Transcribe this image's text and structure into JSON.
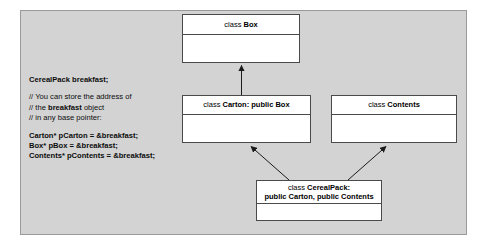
{
  "diagram": {
    "panel_color": "#d3d3d3",
    "box_fill": "#ffffff",
    "border_color": "#4a4a4a",
    "text_color": "#000000"
  },
  "classes": [
    {
      "id": "box",
      "keyword": "class",
      "name": "Box",
      "lines": [
        {
          "kw": "class",
          "nm": "Box"
        }
      ]
    },
    {
      "id": "carton",
      "keyword": "class",
      "name": "Carton: public Box",
      "lines": [
        {
          "kw": "class",
          "nm": "Carton: public Box"
        }
      ]
    },
    {
      "id": "contents",
      "keyword": "class",
      "name": "Contents",
      "lines": [
        {
          "kw": "class",
          "nm": "Contents"
        }
      ]
    },
    {
      "id": "cerealpack",
      "keyword": "class",
      "name": "CerealPack:",
      "lines": [
        {
          "kw": "class",
          "nm": "CerealPack:"
        },
        {
          "kw": "",
          "nm": "public Carton, public Contents"
        }
      ]
    }
  ],
  "relations": [
    {
      "from": "carton",
      "to": "box",
      "type": "inheritance-arrow"
    },
    {
      "from": "cerealpack",
      "to": "carton",
      "type": "inheritance-arrow"
    },
    {
      "from": "cerealpack",
      "to": "contents",
      "type": "inheritance-arrow"
    }
  ],
  "code": {
    "declaration": "CerealPack breakfast;",
    "comments": [
      "// You can store the address of",
      "// the breakfast object",
      "// in any base pointer:"
    ],
    "comment_bold_word": "breakfast",
    "statements": [
      "Carton* pCarton = &breakfast;",
      "Box* pBox = &breakfast;",
      "Contents* pContents = &breakfast;"
    ]
  }
}
